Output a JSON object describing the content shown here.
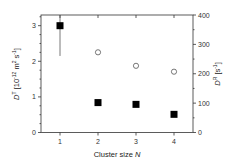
{
  "chart_data": {
    "type": "scatter",
    "title": "",
    "xlabel": "Cluster size N",
    "xlabel_parts": {
      "text": "Cluster size ",
      "var": "N"
    },
    "x": [
      1,
      2,
      3,
      4
    ],
    "xticks": [
      1,
      2,
      3,
      4
    ],
    "xlim": [
      0.5,
      4.5
    ],
    "y_left": {
      "label": "D^T [10^-12 m^2 s^-1]",
      "label_parts": {
        "var": "D",
        "sup_var": "T",
        "unit_pre": " [10",
        "exp1": "-12",
        "unit_mid": " m",
        "exp2": "2",
        "unit_mid2": " s",
        "exp3": "-1",
        "unit_post": "]"
      },
      "ylim": [
        0,
        3.3
      ],
      "ticks": [
        0,
        1,
        2,
        3
      ],
      "minor_step": 0.25
    },
    "y_right": {
      "label": "D^R [s^-1]",
      "label_parts": {
        "var": "D",
        "sup_var": "R",
        "unit_pre": " [s",
        "exp1": "-1",
        "unit_post": "]"
      },
      "ylim": [
        0,
        400
      ],
      "ticks": [
        0,
        100,
        200,
        300,
        400
      ],
      "minor_step": 50
    },
    "series": [
      {
        "name": "D^T (translational)",
        "axis": "left",
        "marker": "filled-square",
        "color": "#000000",
        "x": [
          1,
          2,
          3,
          4
        ],
        "values": [
          3.0,
          0.84,
          0.79,
          0.51
        ],
        "error_bars": [
          {
            "x": 1,
            "low": 2.15,
            "high": 3.3
          }
        ]
      },
      {
        "name": "D^R (rotational)",
        "axis": "right",
        "marker": "open-circle",
        "color": "#555555",
        "x": [
          2,
          3,
          4
        ],
        "values": [
          273,
          227,
          207
        ]
      }
    ],
    "grid": false,
    "legend": null
  },
  "tick_labels": {
    "x": [
      "1",
      "2",
      "3",
      "4"
    ],
    "y_left": [
      "0",
      "1",
      "2",
      "3"
    ],
    "y_right": [
      "0",
      "100",
      "200",
      "300",
      "400"
    ]
  }
}
